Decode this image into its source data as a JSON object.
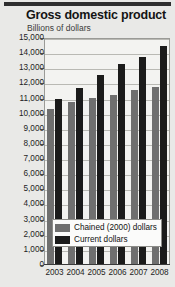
{
  "chart_data": {
    "type": "bar",
    "title": "Gross domestic product",
    "subtitle": "Billions of dollars",
    "xlabel": "",
    "ylabel": "",
    "ylim": [
      0,
      15000
    ],
    "ytick_step": 1000,
    "grid": true,
    "legend_position": "inside-bottom-left",
    "categories": [
      "2003",
      "2004",
      "2005",
      "2006",
      "2007",
      "2008"
    ],
    "ytick_labels": [
      "15,000",
      "14,000",
      "13,000",
      "12,000",
      "11,000",
      "10,000",
      "9,000",
      "8,000",
      "7,000",
      "6,000",
      "5,000",
      "4,000",
      "3,000",
      "2,000",
      "1,000",
      "0"
    ],
    "ytick_values": [
      15000,
      14000,
      13000,
      12000,
      11000,
      10000,
      9000,
      8000,
      7000,
      6000,
      5000,
      4000,
      3000,
      2000,
      1000,
      0
    ],
    "series": [
      {
        "name": "Chained (2000) dollars",
        "color": "#6f6f6f",
        "values": [
          10300,
          10800,
          11050,
          11250,
          11550,
          11750
        ]
      },
      {
        "name": "Current dollars",
        "color": "#1b1b1b",
        "values": [
          11000,
          11700,
          12550,
          13250,
          13750,
          14450
        ]
      }
    ]
  },
  "colors": {
    "page_background": "#e9e9e7",
    "plot_background": "#f3f3f1",
    "gridline": "#b9b9b4",
    "axis": "#3a3a3a",
    "text": "#141414",
    "top_rule": "#2f2f2f",
    "legend_background": "#fbfbfa"
  }
}
